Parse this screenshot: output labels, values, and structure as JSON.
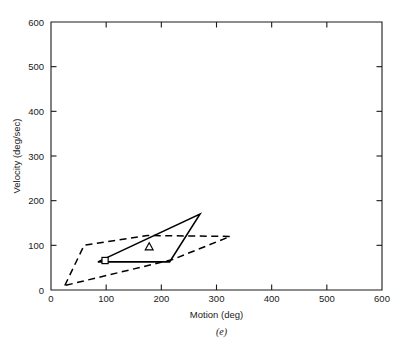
{
  "figure": {
    "caption": "(e)"
  },
  "chart_data": {
    "type": "line",
    "title": "",
    "xlabel": "Motion (deg)",
    "ylabel": "Velocity (deg/sec)",
    "xlim": [
      0,
      600
    ],
    "ylim": [
      0,
      600
    ],
    "xticks": [
      0,
      100,
      200,
      300,
      400,
      500,
      600
    ],
    "yticks": [
      0,
      100,
      200,
      300,
      400,
      500,
      600
    ],
    "xticklabels": [
      "0",
      "100",
      "200",
      "300",
      "400",
      "500",
      "600"
    ],
    "yticklabels": [
      "0",
      "100",
      "200",
      "300",
      "400",
      "500",
      "600"
    ],
    "grid": false,
    "legend": "none",
    "series": [
      {
        "name": "outer-envelope",
        "style": "dashed",
        "closed": true,
        "points": [
          [
            25,
            10
          ],
          [
            60,
            100
          ],
          [
            175,
            122
          ],
          [
            325,
            120
          ],
          [
            220,
            68
          ],
          [
            25,
            10
          ]
        ]
      },
      {
        "name": "inner-envelope",
        "style": "solid",
        "closed": true,
        "points": [
          [
            85,
            63
          ],
          [
            270,
            170
          ],
          [
            215,
            63
          ],
          [
            85,
            63
          ]
        ]
      }
    ],
    "markers": [
      {
        "name": "square-marker",
        "shape": "square",
        "x": 98,
        "y": 66
      },
      {
        "name": "triangle-marker",
        "shape": "triangle",
        "x": 178,
        "y": 97
      }
    ]
  }
}
